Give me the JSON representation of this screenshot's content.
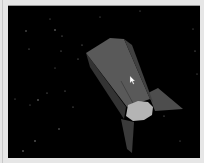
{
  "window": {
    "frame_color": "#e6e6e6",
    "canvas_color": "#000000"
  },
  "scene": {
    "subject": "rocket",
    "background": "starfield",
    "colors": {
      "body_light": "#595959",
      "body_mid": "#4a4a4a",
      "body_dark": "#333333",
      "base_cap": "#b4b4b4",
      "fin": "#4d4d4d",
      "fin_dark": "#3a3a3a",
      "star": "#8a8a8a"
    }
  },
  "cursor": {
    "icon": "arrow-cursor-icon",
    "x": 131,
    "y": 77
  }
}
